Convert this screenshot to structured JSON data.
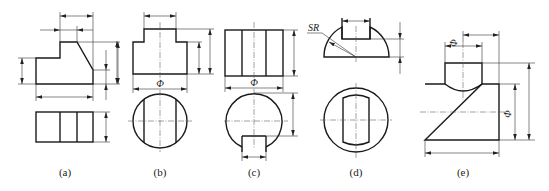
{
  "figure": {
    "colors": {
      "line": "#1a1a1a",
      "dim": "#333333",
      "center": "#555555",
      "background": "#ffffff"
    },
    "panels": [
      {
        "id": "a",
        "label": "(a)",
        "views": [
          "front-view",
          "top-view"
        ],
        "shape": "stepped block with chamfered slope"
      },
      {
        "id": "b",
        "label": "(b)",
        "views": [
          "front-view",
          "top-view"
        ],
        "shape": "stepped cylinder with flats",
        "symbols": [
          "Φ"
        ]
      },
      {
        "id": "c",
        "label": "(c)",
        "views": [
          "front-view",
          "top-view"
        ],
        "shape": "cylinder with rectangular notch",
        "symbols": [
          "Φ"
        ]
      },
      {
        "id": "d",
        "label": "(d)",
        "views": [
          "front-view",
          "top-view"
        ],
        "shape": "hemisphere with slot",
        "symbols": [
          "SR"
        ]
      },
      {
        "id": "e",
        "label": "(e)",
        "views": [
          "front-view"
        ],
        "shape": "intersecting cylinders (tee)",
        "symbols": [
          "Φ",
          "Φ"
        ]
      }
    ]
  },
  "labels": {
    "a": "(a)",
    "b": "(b)",
    "c": "(c)",
    "d": "(d)",
    "e": "(e)"
  },
  "symbols": {
    "b_phi": "Φ",
    "c_phi": "Φ",
    "d_sr": "SR",
    "e_phi_small": "Φ",
    "e_phi_large": "Φ"
  }
}
